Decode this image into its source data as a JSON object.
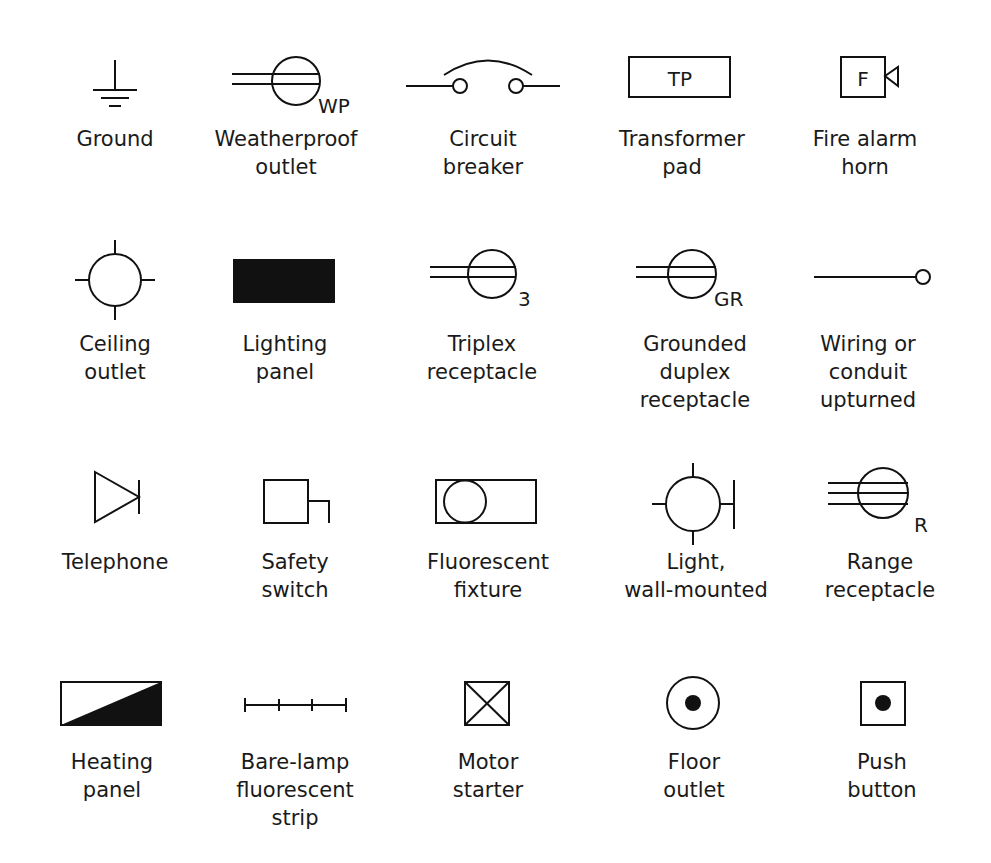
{
  "diagram": {
    "type": "electrical-symbol-legend",
    "rows": 4,
    "columns": 5,
    "line_color": "#111111",
    "background": "#ffffff",
    "symbols": [
      {
        "id": "ground",
        "label": "Ground",
        "icon": "ground-icon",
        "tag": ""
      },
      {
        "id": "weatherproof-outlet",
        "label": "Weatherproof\noutlet",
        "icon": "weatherproof-outlet-icon",
        "tag": "WP"
      },
      {
        "id": "circuit-breaker",
        "label": "Circuit\nbreaker",
        "icon": "circuit-breaker-icon",
        "tag": ""
      },
      {
        "id": "transformer-pad",
        "label": "Transformer\npad",
        "icon": "transformer-pad-icon",
        "tag": "TP"
      },
      {
        "id": "fire-alarm-horn",
        "label": "Fire alarm\nhorn",
        "icon": "fire-alarm-horn-icon",
        "tag": "F"
      },
      {
        "id": "ceiling-outlet",
        "label": "Ceiling\noutlet",
        "icon": "ceiling-outlet-icon",
        "tag": ""
      },
      {
        "id": "lighting-panel",
        "label": "Lighting\npanel",
        "icon": "lighting-panel-icon",
        "tag": ""
      },
      {
        "id": "triplex-receptacle",
        "label": "Triplex\nreceptacle",
        "icon": "triplex-receptacle-icon",
        "tag": "3"
      },
      {
        "id": "grounded-duplex-receptacle",
        "label": "Grounded\nduplex\nreceptacle",
        "icon": "grounded-duplex-receptacle-icon",
        "tag": "GR"
      },
      {
        "id": "wiring-upturned",
        "label": "Wiring or\nconduit\nupturned",
        "icon": "wiring-upturned-icon",
        "tag": ""
      },
      {
        "id": "telephone",
        "label": "Telephone",
        "icon": "telephone-icon",
        "tag": ""
      },
      {
        "id": "safety-switch",
        "label": "Safety\nswitch",
        "icon": "safety-switch-icon",
        "tag": ""
      },
      {
        "id": "fluorescent-fixture",
        "label": "Fluorescent\nfixture",
        "icon": "fluorescent-fixture-icon",
        "tag": ""
      },
      {
        "id": "light-wall-mounted",
        "label": "Light,\nwall-mounted",
        "icon": "wall-light-icon",
        "tag": ""
      },
      {
        "id": "range-receptacle",
        "label": "Range\nreceptacle",
        "icon": "range-receptacle-icon",
        "tag": "R"
      },
      {
        "id": "heating-panel",
        "label": "Heating\npanel",
        "icon": "heating-panel-icon",
        "tag": ""
      },
      {
        "id": "bare-lamp-strip",
        "label": "Bare-lamp\nfluorescent\nstrip",
        "icon": "bare-lamp-strip-icon",
        "tag": ""
      },
      {
        "id": "motor-starter",
        "label": "Motor\nstarter",
        "icon": "motor-starter-icon",
        "tag": ""
      },
      {
        "id": "floor-outlet",
        "label": "Floor\noutlet",
        "icon": "floor-outlet-icon",
        "tag": ""
      },
      {
        "id": "push-button",
        "label": "Push\nbutton",
        "icon": "push-button-icon",
        "tag": ""
      }
    ]
  }
}
